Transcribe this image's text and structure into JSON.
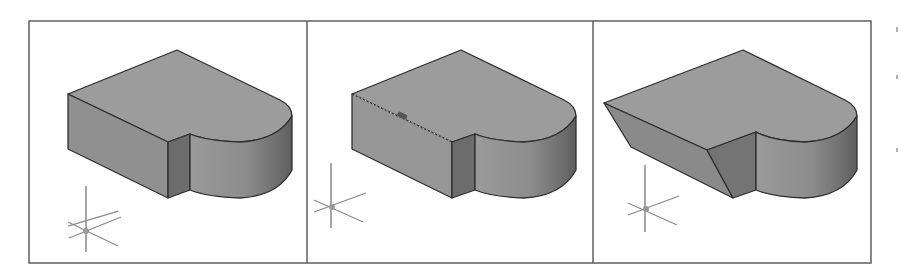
{
  "figure": {
    "colors": {
      "background": "#ffffff",
      "frame": "#555555",
      "top_face": "#9a9a9a",
      "side_face": "#8f8f8f",
      "notch_face": "#6e6e6e",
      "edge": "#2e2e2e",
      "ucs_icon": "#8a8a8a",
      "grip": "#555555"
    },
    "panels": [
      {
        "id": "panel-1",
        "caption": "",
        "state": "original solid"
      },
      {
        "id": "panel-2",
        "caption": "",
        "state": "edge selected (dashed highlight with grip)"
      },
      {
        "id": "panel-3",
        "caption": "",
        "state": "edge chamfered"
      }
    ],
    "ucs_icon": {
      "label": "",
      "type": "3D axes crosshair"
    }
  }
}
